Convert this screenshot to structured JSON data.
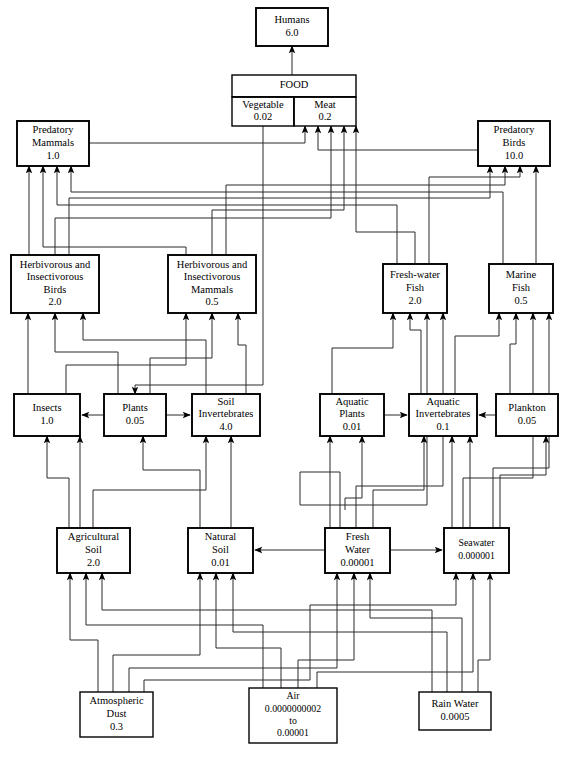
{
  "diagram": {
    "type": "flow-diagram",
    "colors": {
      "background": "#ffffff",
      "box_stroke": "#000000",
      "connector_stroke": "#2a2a2a",
      "text": "#000000"
    },
    "boxes": [
      {
        "id": "humans",
        "name": "humans",
        "lines": [
          "Humans",
          "6.0"
        ],
        "x": 256,
        "y": 8,
        "w": 72,
        "h": 38
      },
      {
        "id": "food",
        "name": "food",
        "lines": [
          "FOOD"
        ],
        "x": 232,
        "y": 75,
        "w": 124,
        "h": 22
      },
      {
        "id": "vegetable",
        "name": "food-vegetable",
        "lines": [
          "Vegetable",
          "0.02"
        ],
        "x": 232,
        "y": 97,
        "w": 62,
        "h": 29
      },
      {
        "id": "meat",
        "name": "food-meat",
        "lines": [
          "Meat",
          "0.2"
        ],
        "x": 294,
        "y": 97,
        "w": 62,
        "h": 29
      },
      {
        "id": "pred_mammals",
        "name": "predatory-mammals",
        "lines": [
          "Predatory",
          "Mammals",
          "1.0"
        ],
        "x": 17,
        "y": 121,
        "w": 72,
        "h": 45
      },
      {
        "id": "pred_birds",
        "name": "predatory-birds",
        "lines": [
          "Predatory",
          "Birds",
          "10.0"
        ],
        "x": 478,
        "y": 121,
        "w": 72,
        "h": 45
      },
      {
        "id": "herb_birds",
        "name": "herbivorous-insectivorous-birds",
        "lines": [
          "Herbivorous and",
          "Insectivorous",
          "Birds",
          "2.0"
        ],
        "x": 11,
        "y": 255,
        "w": 88,
        "h": 58
      },
      {
        "id": "herb_mammals",
        "name": "herbivorous-insectivorous-mammals",
        "lines": [
          "Herbivorous and",
          "Insectivorous",
          "Mammals",
          "0.5"
        ],
        "x": 168,
        "y": 255,
        "w": 88,
        "h": 58
      },
      {
        "id": "fw_fish",
        "name": "fresh-water-fish",
        "lines": [
          "Fresh-water",
          "Fish",
          "2.0"
        ],
        "x": 383,
        "y": 264,
        "w": 64,
        "h": 49
      },
      {
        "id": "marine_fish",
        "name": "marine-fish",
        "lines": [
          "Marine",
          "Fish",
          "0.5"
        ],
        "x": 489,
        "y": 264,
        "w": 64,
        "h": 49
      },
      {
        "id": "insects",
        "name": "insects",
        "lines": [
          "Insects",
          "1.0"
        ],
        "x": 14,
        "y": 394,
        "w": 66,
        "h": 42
      },
      {
        "id": "plants",
        "name": "plants",
        "lines": [
          "Plants",
          "0.05"
        ],
        "x": 104,
        "y": 394,
        "w": 62,
        "h": 42
      },
      {
        "id": "soil_inv",
        "name": "soil-invertebrates",
        "lines": [
          "Soil",
          "Invertebrates",
          "4.0"
        ],
        "x": 192,
        "y": 394,
        "w": 68,
        "h": 42
      },
      {
        "id": "aq_plants",
        "name": "aquatic-plants",
        "lines": [
          "Aquatic",
          "Plants",
          "0.01"
        ],
        "x": 320,
        "y": 394,
        "w": 64,
        "h": 42
      },
      {
        "id": "aq_inv",
        "name": "aquatic-invertebrates",
        "lines": [
          "Aquatic",
          "Invertebrates",
          "0.1"
        ],
        "x": 409,
        "y": 394,
        "w": 68,
        "h": 42
      },
      {
        "id": "plankton",
        "name": "plankton",
        "lines": [
          "Plankton",
          "0.05"
        ],
        "x": 496,
        "y": 394,
        "w": 62,
        "h": 42
      },
      {
        "id": "agri_soil",
        "name": "agricultural-soil",
        "lines": [
          "Agricultural",
          "Soil",
          "2.0"
        ],
        "x": 57,
        "y": 528,
        "w": 73,
        "h": 45
      },
      {
        "id": "nat_soil",
        "name": "natural-soil",
        "lines": [
          "Natural",
          "Soil",
          "0.01"
        ],
        "x": 188,
        "y": 528,
        "w": 65,
        "h": 45
      },
      {
        "id": "fresh_water",
        "name": "fresh-water",
        "lines": [
          "Fresh",
          "Water",
          "0.00001"
        ],
        "x": 325,
        "y": 528,
        "w": 65,
        "h": 45
      },
      {
        "id": "seawater",
        "name": "seawater",
        "lines": [
          "Seawater",
          "0.000001"
        ],
        "x": 444,
        "y": 528,
        "w": 65,
        "h": 45
      },
      {
        "id": "atm_dust",
        "name": "atmospheric-dust",
        "lines": [
          "Atmospheric",
          "Dust",
          "0.3"
        ],
        "x": 80,
        "y": 692,
        "w": 73,
        "h": 45
      },
      {
        "id": "air",
        "name": "air",
        "lines": [
          "Air",
          "0.0000000002",
          "to",
          "0.00001"
        ],
        "x": 249,
        "y": 688,
        "w": 88,
        "h": 55
      },
      {
        "id": "rain_water",
        "name": "rain-water",
        "lines": [
          "Rain Water",
          "0.0005"
        ],
        "x": 419,
        "y": 692,
        "w": 72,
        "h": 38
      }
    ],
    "edges": [
      {
        "from": "food",
        "to": "humans",
        "label": ""
      },
      {
        "from": "vegetable",
        "to": "food",
        "label": ""
      },
      {
        "from": "meat",
        "to": "food",
        "label": ""
      },
      {
        "from": "pred_mammals",
        "to": "meat",
        "label": ""
      },
      {
        "from": "pred_birds",
        "to": "meat",
        "label": ""
      },
      {
        "from": "herb_birds",
        "to": "pred_mammals",
        "label": ""
      },
      {
        "from": "herb_birds",
        "to": "pred_birds",
        "label": ""
      },
      {
        "from": "herb_birds",
        "to": "meat",
        "label": ""
      },
      {
        "from": "herb_mammals",
        "to": "pred_mammals",
        "label": ""
      },
      {
        "from": "herb_mammals",
        "to": "pred_birds",
        "label": ""
      },
      {
        "from": "herb_mammals",
        "to": "meat",
        "label": ""
      },
      {
        "from": "fw_fish",
        "to": "pred_mammals",
        "label": ""
      },
      {
        "from": "fw_fish",
        "to": "pred_birds",
        "label": ""
      },
      {
        "from": "fw_fish",
        "to": "meat",
        "label": ""
      },
      {
        "from": "marine_fish",
        "to": "pred_mammals",
        "label": ""
      },
      {
        "from": "marine_fish",
        "to": "pred_birds",
        "label": ""
      },
      {
        "from": "marine_fish",
        "to": "meat",
        "label": ""
      },
      {
        "from": "plants",
        "to": "insects",
        "label": ""
      },
      {
        "from": "plants",
        "to": "soil_inv",
        "label": ""
      },
      {
        "from": "plants",
        "to": "vegetable",
        "label": ""
      },
      {
        "from": "insects",
        "to": "herb_birds",
        "label": ""
      },
      {
        "from": "plants",
        "to": "herb_birds",
        "label": ""
      },
      {
        "from": "soil_inv",
        "to": "herb_birds",
        "label": ""
      },
      {
        "from": "plants",
        "to": "herb_mammals",
        "label": ""
      },
      {
        "from": "soil_inv",
        "to": "herb_mammals",
        "label": ""
      },
      {
        "from": "insects",
        "to": "herb_mammals",
        "label": ""
      },
      {
        "from": "aq_plants",
        "to": "aq_inv",
        "label": ""
      },
      {
        "from": "plankton",
        "to": "aq_inv",
        "label": ""
      },
      {
        "from": "aq_plants",
        "to": "fw_fish",
        "label": ""
      },
      {
        "from": "aq_inv",
        "to": "fw_fish",
        "label": ""
      },
      {
        "from": "aq_inv",
        "to": "marine_fish",
        "label": ""
      },
      {
        "from": "plankton",
        "to": "marine_fish",
        "label": ""
      },
      {
        "from": "agri_soil",
        "to": "plants",
        "label": ""
      },
      {
        "from": "agri_soil",
        "to": "insects",
        "label": ""
      },
      {
        "from": "agri_soil",
        "to": "soil_inv",
        "label": ""
      },
      {
        "from": "nat_soil",
        "to": "plants",
        "label": ""
      },
      {
        "from": "nat_soil",
        "to": "soil_inv",
        "label": ""
      },
      {
        "from": "fresh_water",
        "to": "nat_soil",
        "label": ""
      },
      {
        "from": "fresh_water",
        "to": "seawater",
        "label": ""
      },
      {
        "from": "fresh_water",
        "to": "aq_plants",
        "label": ""
      },
      {
        "from": "fresh_water",
        "to": "aq_inv",
        "label": ""
      },
      {
        "from": "seawater",
        "to": "plankton",
        "label": ""
      },
      {
        "from": "seawater",
        "to": "aq_inv",
        "label": ""
      },
      {
        "from": "atm_dust",
        "to": "agri_soil",
        "label": ""
      },
      {
        "from": "atm_dust",
        "to": "nat_soil",
        "label": ""
      },
      {
        "from": "atm_dust",
        "to": "fresh_water",
        "label": ""
      },
      {
        "from": "atm_dust",
        "to": "seawater",
        "label": ""
      },
      {
        "from": "air",
        "to": "agri_soil",
        "label": ""
      },
      {
        "from": "air",
        "to": "nat_soil",
        "label": ""
      },
      {
        "from": "air",
        "to": "fresh_water",
        "label": ""
      },
      {
        "from": "air",
        "to": "seawater",
        "label": ""
      },
      {
        "from": "rain_water",
        "to": "agri_soil",
        "label": ""
      },
      {
        "from": "rain_water",
        "to": "nat_soil",
        "label": ""
      },
      {
        "from": "rain_water",
        "to": "fresh_water",
        "label": ""
      },
      {
        "from": "rain_water",
        "to": "seawater",
        "label": ""
      }
    ]
  }
}
